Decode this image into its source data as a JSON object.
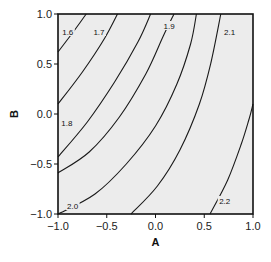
{
  "chart_data": {
    "type": "contour",
    "title": "",
    "xlabel": "A",
    "ylabel": "B",
    "xlim": [
      -1.0,
      1.0
    ],
    "ylim": [
      -1.0,
      1.0
    ],
    "xticks": [
      "-1.0",
      "-0.5",
      "0.0",
      "0.5",
      "1.0"
    ],
    "yticks": [
      "-1.0",
      "-0.5",
      "0.0",
      "0.5",
      "1.0"
    ],
    "grid": false,
    "legend": null,
    "background_color": "#ececec",
    "line_color": "#1a1a1a",
    "contour_levels": [
      {
        "level": 1.6,
        "label": "1.6",
        "points": [
          [
            -1.0,
            0.62
          ],
          [
            -0.86,
            0.8
          ],
          [
            -0.71,
            1.0
          ]
        ]
      },
      {
        "level": 1.7,
        "label": "1.7",
        "points": [
          [
            -1.0,
            0.1
          ],
          [
            -0.75,
            0.42
          ],
          [
            -0.52,
            0.76
          ],
          [
            -0.39,
            1.0
          ]
        ]
      },
      {
        "level": 1.8,
        "label": "1.8",
        "points": [
          [
            -1.0,
            -0.43
          ],
          [
            -0.7,
            -0.08
          ],
          [
            -0.42,
            0.32
          ],
          [
            -0.18,
            0.72
          ],
          [
            -0.05,
            1.0
          ]
        ]
      },
      {
        "level": 1.9,
        "label": "1.9",
        "points": [
          [
            -1.0,
            -0.59
          ],
          [
            -0.68,
            -0.38
          ],
          [
            -0.37,
            -0.03
          ],
          [
            -0.1,
            0.4
          ],
          [
            0.08,
            0.78
          ],
          [
            0.19,
            1.0
          ]
        ]
      },
      {
        "level": 2.0,
        "label": "2.0",
        "points": [
          [
            -1.0,
            -1.0
          ],
          [
            -0.62,
            -0.8
          ],
          [
            -0.3,
            -0.5
          ],
          [
            0.0,
            -0.12
          ],
          [
            0.22,
            0.3
          ],
          [
            0.36,
            0.7
          ],
          [
            0.42,
            1.0
          ]
        ]
      },
      {
        "level": 2.1,
        "label": "2.1",
        "points": [
          [
            -0.25,
            -1.0
          ],
          [
            0.02,
            -0.72
          ],
          [
            0.25,
            -0.36
          ],
          [
            0.45,
            0.1
          ],
          [
            0.57,
            0.52
          ],
          [
            0.67,
            1.0
          ]
        ]
      },
      {
        "level": 2.2,
        "label": "2.2",
        "points": [
          [
            0.56,
            -1.0
          ],
          [
            0.74,
            -0.66
          ],
          [
            0.88,
            -0.3
          ],
          [
            0.96,
            -0.05
          ],
          [
            1.0,
            0.1
          ]
        ]
      }
    ],
    "contour_label_positions": [
      {
        "label": "1.6",
        "x": -0.9,
        "y": 0.81
      },
      {
        "label": "1.7",
        "x": -0.58,
        "y": 0.81
      },
      {
        "label": "1.8",
        "x": -0.91,
        "y": -0.1
      },
      {
        "label": "1.9",
        "x": 0.14,
        "y": 0.87
      },
      {
        "label": "2.0",
        "x": -0.85,
        "y": -0.93
      },
      {
        "label": "2.1",
        "x": 0.76,
        "y": 0.81
      },
      {
        "label": "2.2",
        "x": 0.71,
        "y": -0.88
      }
    ]
  }
}
